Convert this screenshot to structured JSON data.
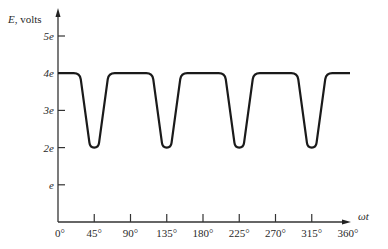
{
  "chart_data": {
    "type": "line",
    "title": "",
    "ylabel_symbol": "E",
    "ylabel_unit": ", volts",
    "xlabel": "ωt",
    "x_ticks": [
      0,
      45,
      90,
      135,
      180,
      225,
      270,
      315,
      360
    ],
    "x_tick_labels": [
      "0°",
      "45°",
      "90°",
      "135°",
      "180°",
      "225°",
      "270°",
      "315°",
      "360°"
    ],
    "y_ticks": [
      1,
      2,
      3,
      4,
      5
    ],
    "y_tick_labels": [
      "e",
      "2e",
      "3e",
      "4e",
      "5e"
    ],
    "xlim": [
      0,
      360
    ],
    "ylim": [
      0,
      5.5
    ],
    "grid": false,
    "legend": null,
    "series": [
      {
        "name": "E",
        "description": "Waveform held at 4e, dipping to 2e in narrow troughs centered at 45°, 135°, 225°, 315°",
        "baseline": 4,
        "trough": 2,
        "trough_centers": [
          45,
          135,
          225,
          315
        ],
        "trough_bottom_halfwidth_deg": 6,
        "trough_top_halfwidth_deg": 18,
        "x": [
          0,
          22,
          27,
          39,
          51,
          63,
          68,
          112,
          117,
          129,
          141,
          153,
          158,
          202,
          207,
          219,
          231,
          243,
          248,
          292,
          297,
          309,
          321,
          333,
          338,
          360
        ],
        "y": [
          4,
          4,
          3.9,
          2,
          2,
          3.9,
          4,
          4,
          3.9,
          2,
          2,
          3.9,
          4,
          4,
          3.9,
          2,
          2,
          3.9,
          4,
          4,
          3.9,
          2,
          2,
          3.9,
          4,
          4
        ]
      }
    ]
  }
}
